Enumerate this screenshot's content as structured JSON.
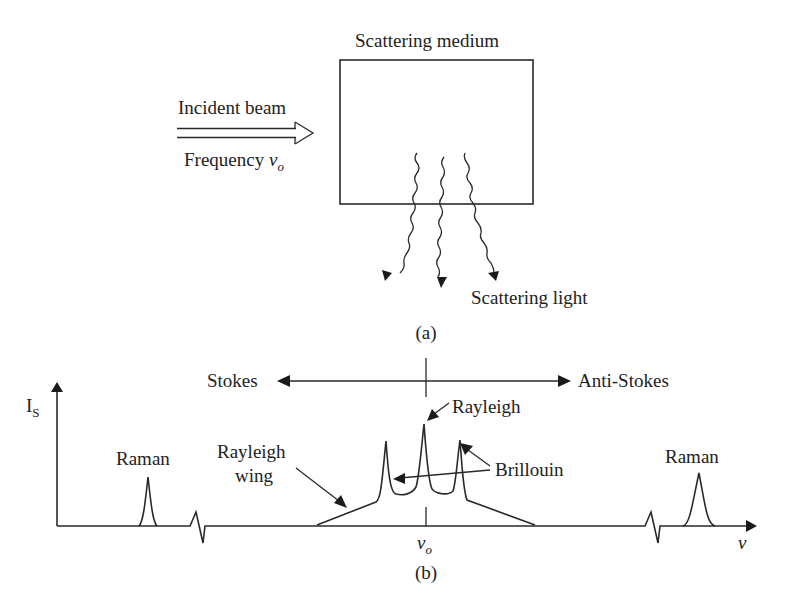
{
  "panel_a": {
    "caption": "(a)",
    "medium_label": "Scattering medium",
    "incident_label": "Incident beam",
    "frequency_label": "Frequency ",
    "frequency_symbol": "ν",
    "frequency_sub": "o",
    "scattered_label": "Scattering light"
  },
  "panel_b": {
    "caption": "(b)",
    "y_axis_label": "I",
    "y_axis_sub": "S",
    "x_axis_label": "ν",
    "center_symbol": "ν",
    "center_sub": "o",
    "stokes_label": "Stokes",
    "anti_stokes_label": "Anti-Stokes",
    "rayleigh_label": "Rayleigh",
    "brillouin_label": "Brillouin",
    "rayleigh_wing_line1": "Rayleigh",
    "rayleigh_wing_line2": "wing",
    "raman_left_label": "Raman",
    "raman_right_label": "Raman"
  },
  "colors": {
    "line": "#2a2a2a",
    "text": "#222222",
    "background": "#ffffff"
  }
}
